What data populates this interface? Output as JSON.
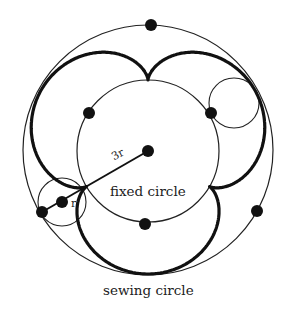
{
  "diagram": {
    "labels": {
      "fixed_circle": "fixed circle",
      "sewing_circle": "sewing circle",
      "big_radius": "3r",
      "small_radius": "r"
    },
    "geometry": {
      "center": [
        148,
        151
      ],
      "fixed_radius": 71,
      "sewing_radius": 125,
      "rolling_radius": 24,
      "cusp_angles_deg": [
        -120,
        0,
        120
      ],
      "rolling_circle_centers": [
        [
          62,
          202
        ],
        [
          234,
          103
        ]
      ]
    },
    "points": [
      {
        "name": "top",
        "x": 151,
        "y": 25
      },
      {
        "name": "upper-left",
        "x": 89,
        "y": 113
      },
      {
        "name": "upper-right",
        "x": 211,
        "y": 113
      },
      {
        "name": "center",
        "x": 148,
        "y": 151
      },
      {
        "name": "bottom-left",
        "x": 42,
        "y": 212
      },
      {
        "name": "bottom",
        "x": 145,
        "y": 224
      },
      {
        "name": "right",
        "x": 257,
        "y": 211
      },
      {
        "name": "rolling-center",
        "x": 62,
        "y": 202
      }
    ],
    "colors": {
      "ink": "#111111",
      "background": "#ffffff"
    }
  }
}
